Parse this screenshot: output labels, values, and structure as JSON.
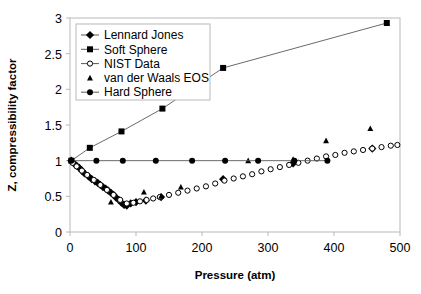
{
  "chart_data": {
    "type": "scatter",
    "title": "",
    "xlabel": "Pressure (atm)",
    "ylabel": "Z, compressibility factor",
    "xlim": [
      0,
      500
    ],
    "ylim": [
      0,
      3
    ],
    "xticks": [
      0,
      100,
      200,
      300,
      400,
      500
    ],
    "xtick_labels": [
      "0",
      "100",
      "200",
      "300",
      "400",
      "500"
    ],
    "yticks": [
      0,
      0.5,
      1,
      1.5,
      2,
      2.5,
      3
    ],
    "ytick_labels": [
      "0",
      "0.5",
      "1",
      "1.5",
      "2",
      "2.5",
      "3"
    ],
    "grid": false,
    "legend_position": "top-left",
    "series": [
      {
        "name": "Lennard Jones",
        "marker": "diamond",
        "line": false,
        "points": [
          [
            2,
            1.0
          ],
          [
            6,
            0.96
          ],
          [
            10,
            0.93
          ],
          [
            14,
            0.9
          ],
          [
            18,
            0.86
          ],
          [
            22,
            0.82
          ],
          [
            28,
            0.78
          ],
          [
            33,
            0.74
          ],
          [
            38,
            0.71
          ],
          [
            42,
            0.69
          ],
          [
            46,
            0.66
          ],
          [
            50,
            0.63
          ],
          [
            54,
            0.61
          ],
          [
            58,
            0.58
          ],
          [
            62,
            0.55
          ],
          [
            66,
            0.52
          ],
          [
            70,
            0.48
          ],
          [
            74,
            0.45
          ],
          [
            78,
            0.41
          ],
          [
            82,
            0.38
          ],
          [
            86,
            0.37
          ],
          [
            92,
            0.4
          ],
          [
            100,
            0.42
          ],
          [
            115,
            0.44
          ],
          [
            138,
            0.49
          ],
          [
            232,
            0.74
          ],
          [
            338,
            0.96
          ],
          [
            458,
            1.17
          ]
        ]
      },
      {
        "name": "Soft Sphere",
        "marker": "square",
        "line": true,
        "points": [
          [
            2,
            1.0
          ],
          [
            30,
            1.18
          ],
          [
            78,
            1.41
          ],
          [
            140,
            1.73
          ],
          [
            232,
            2.3
          ],
          [
            480,
            2.93
          ]
        ]
      },
      {
        "name": "NIST Data",
        "marker": "open-circle",
        "line": false,
        "points": [
          [
            4,
            0.97
          ],
          [
            10,
            0.92
          ],
          [
            18,
            0.86
          ],
          [
            26,
            0.8
          ],
          [
            36,
            0.73
          ],
          [
            46,
            0.66
          ],
          [
            56,
            0.59
          ],
          [
            66,
            0.52
          ],
          [
            76,
            0.45
          ],
          [
            86,
            0.4
          ],
          [
            96,
            0.41
          ],
          [
            106,
            0.43
          ],
          [
            116,
            0.45
          ],
          [
            126,
            0.47
          ],
          [
            136,
            0.49
          ],
          [
            150,
            0.52
          ],
          [
            164,
            0.55
          ],
          [
            178,
            0.58
          ],
          [
            192,
            0.61
          ],
          [
            206,
            0.64
          ],
          [
            220,
            0.68
          ],
          [
            234,
            0.72
          ],
          [
            248,
            0.75
          ],
          [
            262,
            0.78
          ],
          [
            276,
            0.81
          ],
          [
            290,
            0.85
          ],
          [
            304,
            0.88
          ],
          [
            318,
            0.91
          ],
          [
            332,
            0.94
          ],
          [
            346,
            0.97
          ],
          [
            360,
            1.0
          ],
          [
            374,
            1.03
          ],
          [
            388,
            1.06
          ],
          [
            402,
            1.08
          ],
          [
            416,
            1.11
          ],
          [
            430,
            1.13
          ],
          [
            444,
            1.15
          ],
          [
            458,
            1.17
          ],
          [
            472,
            1.19
          ],
          [
            486,
            1.21
          ],
          [
            496,
            1.22
          ]
        ]
      },
      {
        "name": "van der Waals EOS",
        "marker": "triangle",
        "line": false,
        "points": [
          [
            62,
            0.42
          ],
          [
            112,
            0.56
          ],
          [
            138,
            0.5
          ],
          [
            168,
            0.63
          ],
          [
            270,
            1.0
          ],
          [
            338,
            1.02
          ],
          [
            388,
            1.28
          ],
          [
            455,
            1.45
          ]
        ]
      },
      {
        "name": "Hard Sphere",
        "marker": "filled-circle",
        "line": true,
        "points": [
          [
            2,
            1.0
          ],
          [
            40,
            1.0
          ],
          [
            80,
            1.0
          ],
          [
            130,
            1.0
          ],
          [
            185,
            1.0
          ],
          [
            235,
            1.0
          ],
          [
            285,
            1.0
          ],
          [
            340,
            1.0
          ],
          [
            390,
            1.0
          ]
        ]
      }
    ]
  },
  "legend": {
    "items": [
      {
        "label": "Lennard Jones",
        "marker": "diamond",
        "with_line": true
      },
      {
        "label": "Soft Sphere",
        "marker": "square",
        "with_line": true
      },
      {
        "label": "NIST Data",
        "marker": "open-circle",
        "with_line": true
      },
      {
        "label": "van der Waals EOS",
        "marker": "triangle",
        "with_line": false
      },
      {
        "label": "Hard Sphere",
        "marker": "filled-circle",
        "with_line": true
      }
    ]
  },
  "colors": {
    "marker": "#000000",
    "line": "#595959",
    "frame": "#b9b9b9",
    "background": "#ffffff"
  }
}
